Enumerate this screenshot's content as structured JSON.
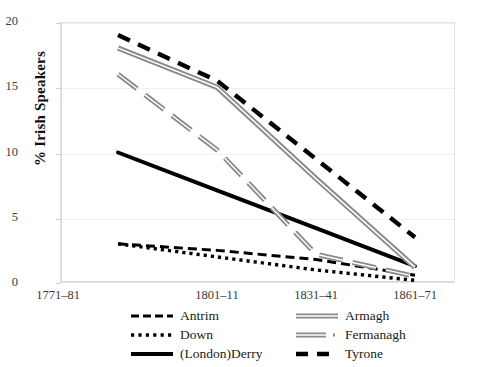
{
  "chart_data": {
    "type": "line",
    "title": "",
    "xlabel": "",
    "ylabel": "% Irish Speakers",
    "categories": [
      "1771–81",
      "1801–11",
      "1831–41",
      "1861–71"
    ],
    "ylim": [
      0,
      20
    ],
    "yticks": [
      "0",
      "5",
      "10",
      "15",
      "20"
    ],
    "grid": true,
    "legend_position": "bottom",
    "series": [
      {
        "name": "Antrim",
        "values": [
          3.0,
          2.5,
          1.8,
          0.6
        ],
        "style": "dashed",
        "color": "#000000",
        "width": 3.0
      },
      {
        "name": "Down",
        "values": [
          3.0,
          2.0,
          1.0,
          0.2
        ],
        "style": "dotted",
        "color": "#000000",
        "width": 3.2
      },
      {
        "name": "(London)Derry",
        "values": [
          10.0,
          7.1,
          4.2,
          1.3
        ],
        "style": "solid",
        "color": "#000000",
        "width": 3.4
      },
      {
        "name": "Armagh",
        "values": [
          18.0,
          15.0,
          8.0,
          1.2
        ],
        "style": "double-solid",
        "color": "#808080",
        "width": 3.6
      },
      {
        "name": "Fermanagh",
        "values": [
          16.0,
          10.2,
          2.2,
          0.5
        ],
        "style": "double-dash",
        "color": "#808080",
        "width": 3.4
      },
      {
        "name": "Tyrone",
        "values": [
          19.0,
          15.5,
          9.5,
          3.5
        ],
        "style": "long-dash",
        "color": "#000000",
        "width": 3.6
      }
    ]
  },
  "legend": {
    "entries": [
      {
        "label": "Antrim",
        "swatch": "antrim-dash-swatch"
      },
      {
        "label": "Armagh",
        "swatch": "armagh-solid-swatch"
      },
      {
        "label": "Down",
        "swatch": "down-dot-swatch"
      },
      {
        "label": "Fermanagh",
        "swatch": "fermanagh-dash-swatch"
      },
      {
        "label": "(London)Derry",
        "swatch": "derry-solid-swatch"
      },
      {
        "label": "Tyrone",
        "swatch": "tyrone-dash-swatch"
      }
    ]
  }
}
